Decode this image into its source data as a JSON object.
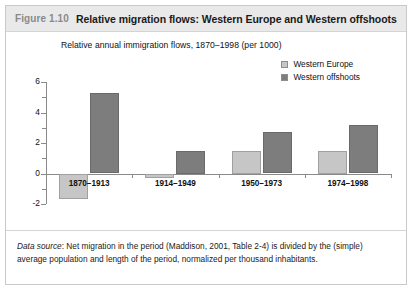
{
  "figure": {
    "number": "Figure 1.10",
    "title": "Relative migration flows: Western Europe and Western offshoots"
  },
  "legend": {
    "position": "top-right",
    "items": [
      {
        "label": "Western Europe",
        "color": "#c6c6c6"
      },
      {
        "label": "Western offshoots",
        "color": "#7d7d7d"
      }
    ]
  },
  "source": {
    "prefix": "Data source",
    "line1": ": Net migration in the period (Maddison, 2001, Table 2-4) is divided by the (simple)",
    "line2": "average population and length of the period, normalized per thousand inhabitants."
  },
  "chart_data": {
    "type": "bar",
    "title": "Relative annual immigration flows, 1870–1998 (per 1000)",
    "xlabel": "",
    "ylabel": "",
    "categories": [
      "1870–1913",
      "1914–1949",
      "1950–1973",
      "1974–1998"
    ],
    "series": [
      {
        "name": "Western Europe",
        "color": "#c6c6c6",
        "values": [
          -1.7,
          -0.3,
          1.5,
          1.5
        ]
      },
      {
        "name": "Western offshoots",
        "color": "#7d7d7d",
        "values": [
          5.3,
          1.5,
          2.7,
          3.15
        ]
      }
    ],
    "ylim": [
      -2,
      6
    ],
    "yticks": [
      -2,
      0,
      2,
      4,
      6
    ],
    "yminorticks": [
      -1,
      1,
      3,
      5
    ],
    "ytick_labels": [
      "-2",
      "0",
      "2",
      "4",
      "6"
    ],
    "grid": false,
    "legend_position": "top-right"
  }
}
